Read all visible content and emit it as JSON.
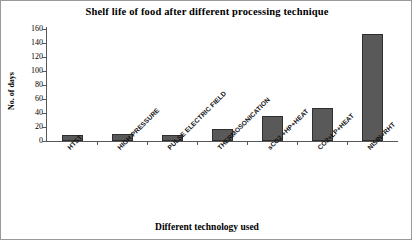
{
  "chart_data": {
    "type": "bar",
    "title": "Shelf life of food after different processing technique",
    "xlabel": "Different technology used",
    "ylabel": "No. of days",
    "categories": [
      "HTST",
      "HIGH PRESSURE",
      "PULSE ELECTRIC FIELD",
      "THERMOSONICATION",
      "sCO2 +HP+HEAT",
      "CO2+LP+HEAT",
      "NISIN+RHT"
    ],
    "values": [
      9,
      10,
      8,
      17,
      36,
      47,
      153
    ],
    "ylim": [
      0,
      160
    ],
    "yticks": [
      0,
      20,
      40,
      60,
      80,
      100,
      120,
      140,
      160
    ],
    "ytick_labels": [
      "0",
      "20",
      "40",
      "60",
      "80",
      "100",
      "120",
      "140",
      "160"
    ],
    "grid": false,
    "legend": false,
    "bar_color": "#595959",
    "bar_edge_color": "#2f2f2f",
    "axis_color": "#575757",
    "category_label_rotation": -45
  }
}
